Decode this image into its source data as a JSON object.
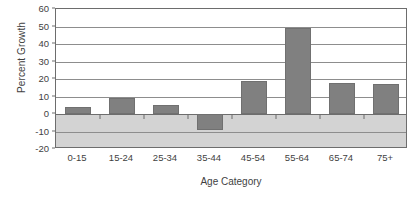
{
  "chart_data": {
    "type": "bar",
    "title": "",
    "xlabel": "Age Category",
    "ylabel": "Percent Growth",
    "categories": [
      "0-15",
      "15-24",
      "25-34",
      "35-44",
      "45-54",
      "55-64",
      "65-74",
      "75+"
    ],
    "values": [
      4,
      9,
      5,
      -9,
      19,
      49,
      18,
      17
    ],
    "ylim": [
      -20,
      60
    ],
    "ytick_values": [
      60,
      50,
      40,
      30,
      20,
      10,
      0,
      -10,
      -20
    ],
    "ytick_labels": [
      "60",
      "50",
      "40",
      "30",
      "20",
      "10",
      "0",
      "-10",
      "-20"
    ],
    "ytick_step": 10,
    "grid": true,
    "legend": false,
    "bar_color": "#808080",
    "plot_border_color": "#6d6d6d",
    "gridline_color": "#8d8d8d",
    "negative_band_color": "#d3d3d3",
    "background_color": "#ffffff"
  }
}
